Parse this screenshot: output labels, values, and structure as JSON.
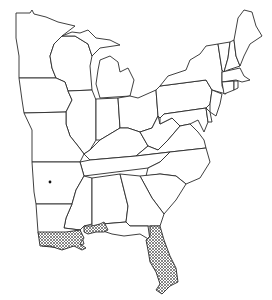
{
  "map": {
    "title": "",
    "region": "Eastern United States",
    "background_color": "#ffffff",
    "line_color": "#2a2a2a",
    "hatch_color": "#555555",
    "states": [
      "MN",
      "WI",
      "MI",
      "IA",
      "IL",
      "IN",
      "OH",
      "MO",
      "KY",
      "WV",
      "PA",
      "NY",
      "VT",
      "NH",
      "ME",
      "MA",
      "CT",
      "RI",
      "NJ",
      "DE",
      "MD",
      "VA",
      "TN",
      "NC",
      "SC",
      "AR",
      "MS",
      "AL",
      "GA",
      "LA",
      "FL"
    ],
    "hatched_areas": [
      {
        "name": "Louisiana coast"
      },
      {
        "name": "Mississippi-Alabama coast"
      },
      {
        "name": "Florida peninsula"
      }
    ],
    "point_markers": [
      {
        "name": "Arkansas locality",
        "x": 50,
        "y": 182
      }
    ]
  }
}
